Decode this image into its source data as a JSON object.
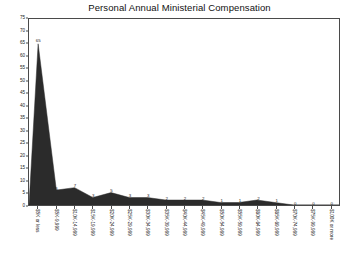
{
  "chart_data": {
    "type": "area",
    "title": "Personal Annual Ministerial Compensation",
    "xlabel": "",
    "ylabel": "",
    "ylim": [
      0,
      75
    ],
    "ytick_step": 5,
    "yticks": [
      0,
      5,
      10,
      15,
      20,
      25,
      30,
      35,
      40,
      45,
      50,
      55,
      60,
      65,
      70,
      75
    ],
    "grid": false,
    "legend": "none",
    "series_color": "#2b2b2b",
    "axis_color": "#4a4a4a",
    "categories": [
      "$5K or less",
      "$5K-9,999",
      "$10K-14,999",
      "$15K-19,999",
      "$20K-24,999",
      "$25K-29,999",
      "$30K-34,999",
      "$35K-39,999",
      "$40K-44,999",
      "$45K-49,999",
      "$50K-54,999",
      "$55K-59,999",
      "$60K-64,999",
      "$65K-69,999",
      "$70K-74,999",
      "$75K-99,999",
      "$100K or more"
    ],
    "values": [
      65,
      6,
      7,
      3,
      5,
      3,
      3,
      2,
      2,
      2,
      1,
      1,
      2,
      1,
      0,
      0,
      0
    ],
    "point_labels": [
      "65",
      "6",
      "7",
      "3",
      "5",
      "3",
      "3",
      "2",
      "2",
      "2",
      "1",
      "1",
      "2",
      "1",
      "0",
      "0",
      "0"
    ]
  }
}
